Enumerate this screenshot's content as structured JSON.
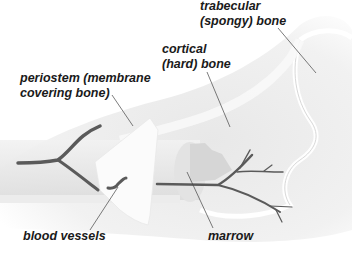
{
  "diagram": {
    "labels": {
      "trabecular_line1": "trabecular",
      "trabecular_line2": "(spongy) bone",
      "cortical_line1": "cortical",
      "cortical_line2": "(hard) bone",
      "periostem_line1": "periostem (membrane",
      "periostem_line2": "covering bone)",
      "blood_vessels": "blood vessels",
      "marrow": "marrow"
    },
    "colors": {
      "background": "#ffffff",
      "bone_shade": "#e6e6e6",
      "bone_light": "#f6f6f6",
      "vessel": "#555555",
      "leader_line": "#444444",
      "text": "#1a1a1a"
    }
  }
}
